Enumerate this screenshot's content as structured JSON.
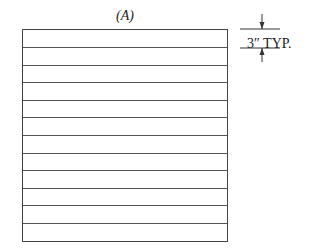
{
  "diagram": {
    "title": "(A)",
    "row_count": 12,
    "dimension": {
      "label": "3″ TYP."
    }
  }
}
